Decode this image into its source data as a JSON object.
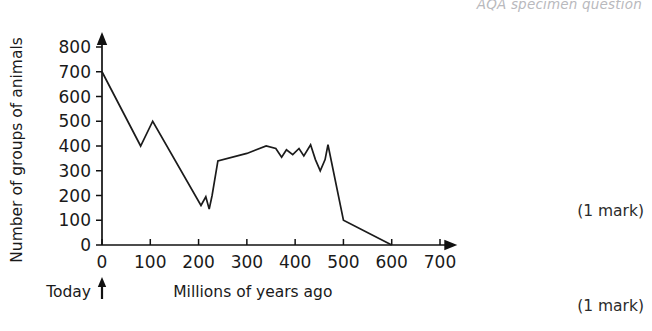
{
  "header": {
    "note": "AQA specimen question"
  },
  "marks": [
    {
      "label": "(1 mark)"
    },
    {
      "label": "(1 mark)"
    }
  ],
  "chart_data": {
    "type": "line",
    "title": "",
    "xlabel": "Millions of years ago",
    "ylabel": "Number of groups of animals",
    "origin_annotation": "Today",
    "xlim": [
      0,
      740
    ],
    "ylim": [
      0,
      840
    ],
    "xticks": [
      0,
      100,
      200,
      300,
      400,
      500,
      600,
      700
    ],
    "xtick_labels": [
      "0",
      "100",
      "200",
      "300",
      "400",
      "500",
      "600",
      "700"
    ],
    "yticks": [
      0,
      100,
      200,
      300,
      400,
      500,
      600,
      700,
      800
    ],
    "ytick_labels": [
      "0",
      "100",
      "200",
      "300",
      "400",
      "500",
      "600",
      "700",
      "800"
    ],
    "grid": false,
    "legend": false,
    "axis_arrows": true,
    "series": [
      {
        "name": "Number of groups of animals",
        "color": "#1b1b1b",
        "x": [
          0,
          80,
          105,
          205,
          215,
          222,
          228,
          240,
          300,
          340,
          360,
          372,
          382,
          395,
          408,
          418,
          432,
          442,
          452,
          462,
          468,
          500,
          600
        ],
        "y": [
          700,
          400,
          500,
          160,
          195,
          145,
          200,
          340,
          370,
          400,
          390,
          355,
          385,
          365,
          390,
          360,
          405,
          345,
          300,
          345,
          405,
          100,
          0
        ]
      }
    ]
  }
}
